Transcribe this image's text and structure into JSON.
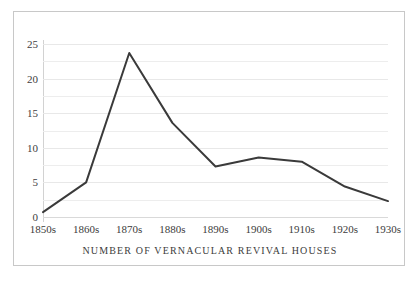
{
  "figure": {
    "border_color": "#c8c8c8",
    "background": "#ffffff"
  },
  "chart_data": {
    "type": "line",
    "title": "",
    "subtitle": "",
    "xlabel": "NUMBER OF VERNACULAR REVIVAL HOUSES",
    "ylabel": "",
    "categories": [
      "1850s",
      "1860s",
      "1870s",
      "1880s",
      "1890s",
      "1900s",
      "1910s",
      "1920s",
      "1930s"
    ],
    "values": [
      0.7,
      5.0,
      23.7,
      13.6,
      7.3,
      8.6,
      8.0,
      4.4,
      2.3
    ],
    "series": [
      {
        "name": "Vernacular Revival houses",
        "values": [
          0.7,
          5.0,
          23.7,
          13.6,
          7.3,
          8.6,
          8.0,
          4.4,
          2.3
        ],
        "color": "#3a3a3a",
        "line_width": 2
      }
    ],
    "ylim": [
      0,
      25
    ],
    "xlim": [
      0,
      8
    ],
    "y_major_ticks": [
      0,
      5,
      10,
      15,
      20,
      25
    ],
    "y_tick_labels": [
      "0",
      "5",
      "10",
      "15",
      "20",
      "25"
    ],
    "y_minor_ticks": [
      2.5,
      7.5,
      12.5,
      17.5,
      22.5
    ],
    "grid": true,
    "grid_axis": "y",
    "grid_color": "#ededed",
    "legend": false,
    "legend_position": "none",
    "markers": false
  }
}
